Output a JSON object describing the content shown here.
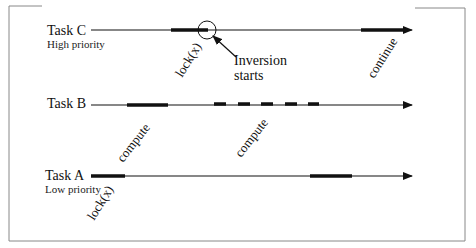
{
  "diagram": {
    "type": "priority-inversion-timeline",
    "tasks": [
      {
        "name": "Task C",
        "subtitle": "High priority",
        "events": [
          {
            "label": "lock(x)",
            "kind": "thick-segment"
          },
          {
            "label": "continue",
            "kind": "thick-segment"
          }
        ]
      },
      {
        "name": "Task B",
        "subtitle": "",
        "events": [
          {
            "label": "compute",
            "kind": "thick-segment"
          },
          {
            "label": "compute",
            "kind": "dashed-segment"
          }
        ]
      },
      {
        "name": "Task A",
        "subtitle": "Low priority",
        "events": [
          {
            "label": "lock(x)",
            "kind": "thick-segment"
          },
          {
            "label": "unlock(x)",
            "kind": "thick-segment"
          }
        ]
      }
    ],
    "annotation": {
      "line1": "Inversion",
      "line2": "starts"
    }
  },
  "labels": {
    "taskC": "Task C",
    "taskC_sub": "High priority",
    "taskB": "Task B",
    "taskA": "Task A",
    "taskA_sub": "Low priority",
    "c_lock": "lock(x)",
    "c_continue": "continue",
    "b_compute1": "compute",
    "b_compute2": "compute",
    "a_lock": "lock(x)",
    "a_unlock": "unlock(x)",
    "inv1": "Inversion",
    "inv2": "starts"
  }
}
